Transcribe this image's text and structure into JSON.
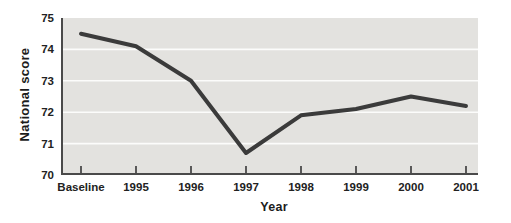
{
  "chart_data": {
    "type": "line",
    "categories": [
      "Baseline",
      "1995",
      "1996",
      "1997",
      "1998",
      "1999",
      "2000",
      "2001"
    ],
    "values": [
      74.5,
      74.1,
      73.0,
      70.7,
      71.9,
      72.1,
      72.5,
      72.2
    ],
    "xlabel": "Year",
    "ylabel": "National score",
    "ylim": [
      70,
      75
    ],
    "y_ticks": [
      70,
      71,
      72,
      73,
      74,
      75
    ],
    "grid": true,
    "legend": "none",
    "colors": {
      "plot_background": "#e3e2df",
      "series_line": "#3b3b3b",
      "axis": "#4a4a4a",
      "gridline": "#fcfcfb",
      "label_text": "#222222"
    }
  }
}
